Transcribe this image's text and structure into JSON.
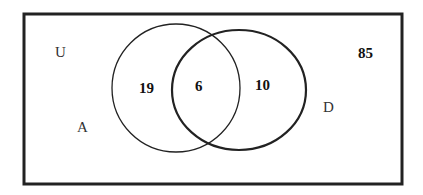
{
  "diagram": {
    "type": "venn",
    "universe_label": "U",
    "sets": [
      {
        "name": "A",
        "label": "A",
        "only_count": "19"
      },
      {
        "name": "D",
        "label": "D",
        "only_count": "10"
      }
    ],
    "intersection_count": "6",
    "outside_count": "85",
    "colors": {
      "stroke": "#222222",
      "background": "#ffffff"
    }
  }
}
